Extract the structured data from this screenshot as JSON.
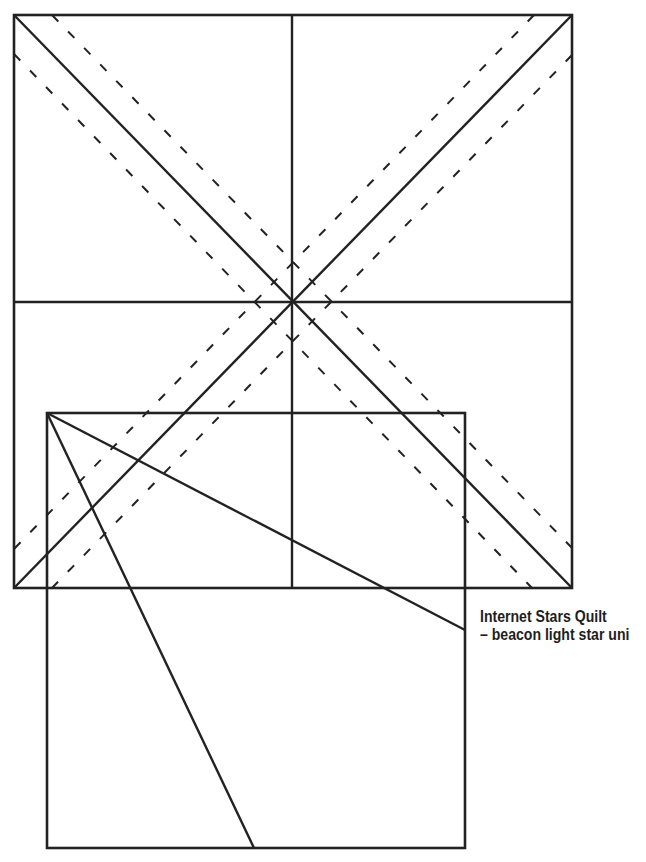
{
  "caption": {
    "line1": "Internet Stars Quilt",
    "line2": "– beacon light star uni"
  },
  "colors": {
    "stroke": "#222222",
    "background": "#ffffff"
  },
  "diagram": {
    "outer_square": {
      "x1": 14,
      "y1": 15,
      "x2": 572,
      "y2": 588
    },
    "center": {
      "x": 292,
      "y": 302
    },
    "solid_lines": [
      {
        "name": "vertical-center-line",
        "x1": 292,
        "y1": 15,
        "x2": 292,
        "y2": 588
      },
      {
        "name": "horizontal-center-line",
        "x1": 14,
        "y1": 302,
        "x2": 572,
        "y2": 302
      },
      {
        "name": "diagonal-tl-br",
        "x1": 14,
        "y1": 15,
        "x2": 572,
        "y2": 588
      },
      {
        "name": "diagonal-tr-bl",
        "x1": 572,
        "y1": 15,
        "x2": 14,
        "y2": 588
      }
    ],
    "dashed_lines": [
      {
        "name": "seam-tl-br-upper",
        "x1": 52,
        "y1": 15,
        "x2": 572,
        "y2": 548
      },
      {
        "name": "seam-tl-br-lower",
        "x1": 14,
        "y1": 54,
        "x2": 532,
        "y2": 588
      },
      {
        "name": "seam-tr-bl-upper",
        "x1": 534,
        "y1": 15,
        "x2": 14,
        "y2": 549
      },
      {
        "name": "seam-tr-bl-lower",
        "x1": 572,
        "y1": 55,
        "x2": 52,
        "y2": 588
      }
    ],
    "inner_rect": {
      "x1": 47,
      "y1": 413,
      "x2": 465,
      "y2": 848
    },
    "template_lines": [
      {
        "name": "template-line-right",
        "x1": 47,
        "y1": 413,
        "x2": 465,
        "y2": 630
      },
      {
        "name": "template-line-bottom",
        "x1": 47,
        "y1": 413,
        "x2": 254,
        "y2": 848
      }
    ]
  }
}
